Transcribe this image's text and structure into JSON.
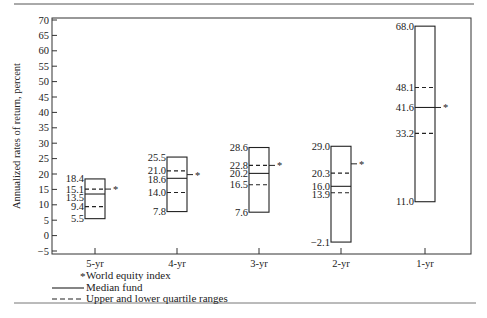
{
  "chart_data": {
    "type": "box",
    "title": "",
    "ylabel": "Annualized rates of return, percent",
    "xlabel": "",
    "ylim": [
      -5,
      70
    ],
    "yticks": [
      70,
      65,
      60,
      55,
      50,
      45,
      40,
      35,
      30,
      25,
      20,
      15,
      10,
      5,
      0,
      -5
    ],
    "categories": [
      "5-yr",
      "4-yr",
      "3-yr",
      "2-yr",
      "1-yr"
    ],
    "series": [
      {
        "category": "5-yr",
        "high": 18.4,
        "upper_quartile": 15.1,
        "median": 13.5,
        "lower_quartile": 9.4,
        "low": 5.5,
        "world_index": 15.1
      },
      {
        "category": "4-yr",
        "high": 25.5,
        "upper_quartile": 21.0,
        "median": 18.6,
        "lower_quartile": 14.0,
        "low": 7.8,
        "world_index": 19.8
      },
      {
        "category": "3-yr",
        "high": 28.6,
        "upper_quartile": 22.8,
        "median": 20.2,
        "lower_quartile": 16.5,
        "low": 7.6,
        "world_index": 22.8
      },
      {
        "category": "2-yr",
        "high": 29.0,
        "upper_quartile": 20.3,
        "median": 16.0,
        "lower_quartile": 13.9,
        "low": -2.1,
        "world_index": 23.3
      },
      {
        "category": "1-yr",
        "high": 68.0,
        "upper_quartile": 48.1,
        "median": 41.6,
        "lower_quartile": 33.2,
        "low": 11.0,
        "world_index": 41.6
      }
    ],
    "labels": {
      "5-yr": [
        "18.4",
        "15.1",
        "13.5",
        "9.4",
        "5.5"
      ],
      "4-yr": [
        "25.5",
        "21.0",
        "18.6",
        "14.0",
        "7.8"
      ],
      "3-yr": [
        "28.6",
        "22.8",
        "20.2",
        "16.5",
        "7.6"
      ],
      "2-yr": [
        "29.0",
        "20.3",
        "16.0",
        "13.9",
        "−2.1"
      ],
      "1-yr": [
        "68.0",
        "48.1",
        "41.6",
        "33.2",
        "11.0"
      ]
    },
    "legend": [
      {
        "symbol": "*",
        "label": "World equity index"
      },
      {
        "symbol": "solid-line",
        "label": "Median fund"
      },
      {
        "symbol": "dashed-line",
        "label": "Upper and lower quartile ranges"
      }
    ],
    "legend_position": "bottom-left",
    "grid": false
  },
  "legend": {
    "star": "*",
    "world": "World equity index",
    "median": "Median fund",
    "quartile": "Upper and lower quartile ranges"
  }
}
